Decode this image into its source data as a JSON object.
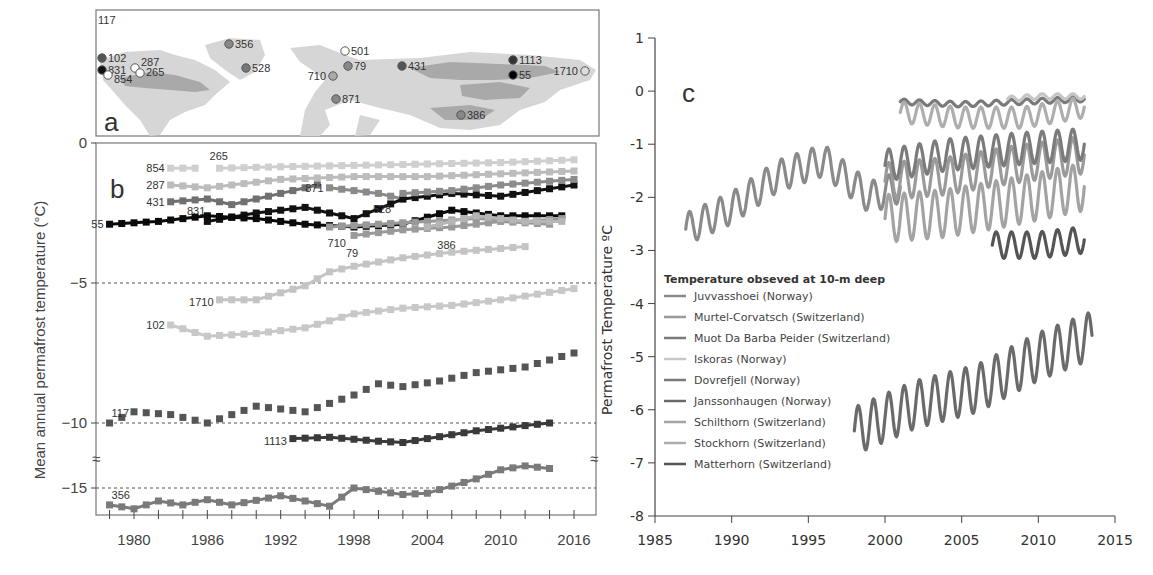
{
  "figure": {
    "panel_a": {
      "letter": "a"
    },
    "panel_b": {
      "letter": "b",
      "ylabel": "Mean annual permafrost temperature (°C)"
    },
    "panel_c": {
      "letter": "c",
      "ylabel": "Permafrost Temperature ºC",
      "legend_title": "Temperature obseved at 10-m deep"
    }
  },
  "chart_data": [
    {
      "panel": "a",
      "type": "map",
      "title": "Borehole site locations",
      "sites": [
        {
          "id": "117",
          "x": 102,
          "y": 18
        },
        {
          "id": "102",
          "x": 102,
          "y": 58
        },
        {
          "id": "831",
          "x": 102,
          "y": 70
        },
        {
          "id": "854",
          "x": 108,
          "y": 75
        },
        {
          "id": "287",
          "x": 135,
          "y": 68
        },
        {
          "id": "265",
          "x": 140,
          "y": 73
        },
        {
          "id": "356",
          "x": 229,
          "y": 44
        },
        {
          "id": "528",
          "x": 246,
          "y": 68
        },
        {
          "id": "501",
          "x": 345,
          "y": 51
        },
        {
          "id": "79",
          "x": 348,
          "y": 66
        },
        {
          "id": "710",
          "x": 333,
          "y": 76
        },
        {
          "id": "871",
          "x": 336,
          "y": 99
        },
        {
          "id": "431",
          "x": 402,
          "y": 66
        },
        {
          "id": "1113",
          "x": 513,
          "y": 60
        },
        {
          "id": "55",
          "x": 513,
          "y": 75
        },
        {
          "id": "1710",
          "x": 585,
          "y": 71
        },
        {
          "id": "386",
          "x": 461,
          "y": 115
        }
      ]
    },
    {
      "panel": "b",
      "type": "line",
      "title": "",
      "xlabel": "",
      "ylabel": "Mean annual permafrost temperature (°C)",
      "x_ticks": [
        "1980",
        "1986",
        "1992",
        "1998",
        "2004",
        "2010",
        "2016"
      ],
      "y_ticks": [
        "0",
        "-5",
        "-10",
        "-15"
      ],
      "xlim": [
        1977,
        2017
      ],
      "ylim": [
        -17,
        0
      ],
      "axis_break": "between -10 and -15",
      "reference_lines": [
        -5,
        -10,
        -15
      ],
      "series": [
        {
          "name": "854",
          "x": [
            1983,
            1984,
            1985
          ],
          "values": [
            -0.9,
            -0.9,
            -0.9
          ]
        },
        {
          "name": "265",
          "x": [
            1987,
            1992,
            1998,
            2004,
            2010,
            2016
          ],
          "values": [
            -0.9,
            -0.85,
            -0.8,
            -0.75,
            -0.7,
            -0.6
          ]
        },
        {
          "name": "287",
          "x": [
            1983,
            1986,
            1992,
            1998,
            2004,
            2010,
            2016
          ],
          "values": [
            -1.5,
            -1.6,
            -1.3,
            -1.2,
            -1.2,
            -1.1,
            -1.0
          ]
        },
        {
          "name": "431",
          "x": [
            1983,
            1986,
            1988,
            1990,
            1993,
            1995
          ],
          "values": [
            -2.1,
            -2.0,
            -2.2,
            -2.0,
            -1.7,
            -1.5
          ]
        },
        {
          "name": "871",
          "x": [
            1996,
            1998,
            2000,
            2002
          ],
          "values": [
            -1.6,
            -1.7,
            -1.8,
            -2.0
          ]
        },
        {
          "name": "831",
          "x": [
            1986,
            1990,
            1994,
            1998,
            2002,
            2006,
            2010,
            2016
          ],
          "values": [
            -2.8,
            -2.5,
            -2.3,
            -2.7,
            -2.0,
            -1.8,
            -1.9,
            -1.5
          ]
        },
        {
          "name": "55",
          "x": [
            1978,
            1982,
            1986,
            1990,
            1994,
            1998,
            2002,
            2006,
            2010,
            2015
          ],
          "values": [
            -2.9,
            -2.8,
            -2.6,
            -2.7,
            -2.9,
            -3.0,
            -2.9,
            -2.4,
            -2.6,
            -2.6
          ]
        },
        {
          "name": "710",
          "x": [
            1996,
            2000,
            2004,
            2008,
            2012,
            2015
          ],
          "values": [
            -3.0,
            -2.9,
            -2.8,
            -2.7,
            -2.8,
            -2.7
          ]
        },
        {
          "name": "79",
          "x": [
            1998,
            2002,
            2006,
            2010,
            2014
          ],
          "values": [
            -3.3,
            -3.1,
            -3.0,
            -2.8,
            -2.9
          ]
        },
        {
          "name": "386",
          "x": [
            2004,
            2008,
            2012,
            2015
          ],
          "values": [
            -3.0,
            -2.6,
            -2.8,
            -2.8
          ]
        },
        {
          "name": "528",
          "x": [
            2002,
            2006,
            2010,
            2016
          ],
          "values": [
            -1.8,
            -1.7,
            -1.5,
            -1.3
          ]
        },
        {
          "name": "1710",
          "x": [
            1987,
            1990,
            1994,
            1996,
            1998,
            2002,
            2006,
            2012
          ],
          "values": [
            -5.6,
            -5.6,
            -5.1,
            -4.6,
            -4.4,
            -4.1,
            -3.9,
            -3.7
          ]
        },
        {
          "name": "102",
          "x": [
            1983,
            1986,
            1990,
            1994,
            1998,
            2002,
            2006,
            2010,
            2016
          ],
          "values": [
            -6.5,
            -6.9,
            -6.8,
            -6.6,
            -6.1,
            -5.9,
            -5.8,
            -5.6,
            -5.2
          ]
        },
        {
          "name": "117",
          "x": [
            1978,
            1980,
            1983,
            1986,
            1990,
            1994,
            1998,
            2000,
            2002,
            2005,
            2008,
            2012,
            2016
          ],
          "values": [
            -10.0,
            -9.6,
            -9.7,
            -10.0,
            -9.4,
            -9.6,
            -9.0,
            -8.6,
            -8.7,
            -8.5,
            -8.2,
            -8.0,
            -7.5
          ]
        },
        {
          "name": "1113",
          "x": [
            1993,
            1996,
            2000,
            2002,
            2004,
            2008,
            2012,
            2014
          ],
          "values": [
            -11.2,
            -11.1,
            -11.4,
            -11.5,
            -11.2,
            -10.6,
            -10.2,
            -10.0
          ]
        },
        {
          "name": "356",
          "x": [
            1978,
            1980,
            1982,
            1984,
            1986,
            1988,
            1992,
            1994,
            1996,
            1998,
            2002,
            2004,
            2008,
            2010,
            2012,
            2014
          ],
          "values": [
            -16.3,
            -16.6,
            -16.0,
            -16.3,
            -15.9,
            -16.3,
            -15.6,
            -16.0,
            -16.4,
            -15.0,
            -15.5,
            -15.4,
            -14.3,
            -13.6,
            -13.3,
            -13.5
          ]
        }
      ]
    },
    {
      "panel": "c",
      "type": "line",
      "title": "",
      "xlabel": "",
      "ylabel": "Permafrost Temperature ºC",
      "x_ticks": [
        "1985",
        "1990",
        "1995",
        "2000",
        "2005",
        "2010",
        "2015"
      ],
      "y_ticks": [
        "1",
        "0",
        "-1",
        "-2",
        "-3",
        "-4",
        "-5",
        "-6",
        "-7",
        "-8"
      ],
      "xlim": [
        1985,
        2015
      ],
      "ylim": [
        -8,
        1
      ],
      "legend_title": "Temperature obseved at 10-m deep",
      "legend_position": "lower-left",
      "series": [
        {
          "name": "Juvvasshoei (Norway)",
          "color": "#8a8a8a",
          "x": [
            1987,
            1990,
            1993,
            1996,
            1999,
            2001
          ],
          "values": [
            -2.6,
            -2.2,
            -1.6,
            -1.3,
            -2.0,
            -1.8
          ]
        },
        {
          "name": "Murtel-Corvatsch (Switzerland)",
          "color": "#9a9a9a",
          "x": [
            2000,
            2004,
            2008,
            2013
          ],
          "values": [
            -1.7,
            -1.6,
            -1.4,
            -1.2
          ]
        },
        {
          "name": "Muot Da Barba Peider (Switzerland)",
          "color": "#7a7a7a",
          "x": [
            2001,
            2005,
            2009,
            2013
          ],
          "values": [
            -0.2,
            -0.25,
            -0.2,
            -0.15
          ]
        },
        {
          "name": "Iskoras (Norway)",
          "color": "#c6c6c6",
          "x": [
            2008,
            2010,
            2013
          ],
          "values": [
            -0.15,
            -0.1,
            -0.1
          ]
        },
        {
          "name": "Dovrefjell (Norway)",
          "color": "#7b7b7b",
          "x": [
            2000,
            2004,
            2008,
            2013
          ],
          "values": [
            -1.4,
            -1.2,
            -1.1,
            -1.0
          ]
        },
        {
          "name": "Janssonhaugen (Norway)",
          "color": "#6a6a6a",
          "x": [
            1998,
            2002,
            2006,
            2010,
            2013.5
          ],
          "values": [
            -6.4,
            -5.9,
            -5.6,
            -5.0,
            -4.6
          ]
        },
        {
          "name": "Schilthorn (Switzerland)",
          "color": "#a3a3a3",
          "x": [
            2000,
            2004,
            2008,
            2013
          ],
          "values": [
            -2.4,
            -2.3,
            -2.1,
            -1.8
          ]
        },
        {
          "name": "Stockhorn (Switzerland)",
          "color": "#aeaeae",
          "x": [
            2001,
            2005,
            2009,
            2013
          ],
          "values": [
            -0.4,
            -0.5,
            -0.5,
            -0.3
          ]
        },
        {
          "name": "Matterhorn (Switzerland)",
          "color": "#555555",
          "x": [
            2007,
            2010,
            2013
          ],
          "values": [
            -2.9,
            -2.9,
            -2.8
          ]
        }
      ]
    }
  ]
}
